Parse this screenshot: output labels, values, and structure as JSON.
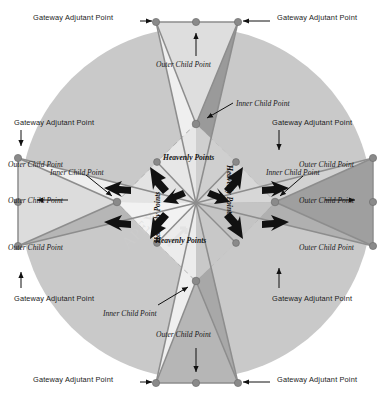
{
  "figure": {
    "background_color": "#ffffff",
    "circle": {
      "fill": "#c9c9c9",
      "center_x": 196,
      "center_y": 203,
      "radius": 176
    },
    "colors": {
      "circle_gray": "#c9c9c9",
      "light_blade": "#efefef",
      "mid_blade": "#b6b6b6",
      "dark_blade": "#9a9a9a",
      "line_gray": "#8d8d8d",
      "node_gray": "#8a8a8a",
      "dashed_gray": "#a8a8a8",
      "arrow_black": "#111111",
      "text_black": "#1b1b1b",
      "watermark": "#d8d8d8"
    },
    "watermark_text": "APEX"
  },
  "labels": {
    "gateway": "Gateway Adjutant Point",
    "outer_child": "Outer Child Point",
    "inner_child": "Inner Child Point",
    "heavenly": "Heavenly Points"
  },
  "callouts": [
    {
      "id": "gw-top-left",
      "text": "Gateway Adjutant Point",
      "x": 58,
      "y": 15,
      "arrow": "right"
    },
    {
      "id": "gw-top-right",
      "text": "Gateway Adjutant Point",
      "x": 280,
      "y": 15,
      "arrow": "left"
    },
    {
      "id": "gw-left-upper",
      "text": "Gateway Adjutant Point",
      "x": 16,
      "y": 122,
      "arrow": "down"
    },
    {
      "id": "gw-right-upper",
      "text": "Gateway Adjutant Point",
      "x": 274,
      "y": 122,
      "arrow": "down"
    },
    {
      "id": "gw-left-lower",
      "text": "Gateway Adjutant Point",
      "x": 16,
      "y": 290,
      "arrow": "up"
    },
    {
      "id": "gw-right-lower",
      "text": "Gateway Adjutant Point",
      "x": 274,
      "y": 290,
      "arrow": "up"
    },
    {
      "id": "gw-bottom-left",
      "text": "Gateway Adjutant Point",
      "x": 58,
      "y": 380,
      "arrow": "right"
    },
    {
      "id": "gw-bottom-right",
      "text": "Gateway Adjutant Point",
      "x": 280,
      "y": 380,
      "arrow": "left"
    },
    {
      "id": "oc-top",
      "text": "Outer Child Point",
      "x": 160,
      "y": 65,
      "arrow": "up"
    },
    {
      "id": "oc-bottom",
      "text": "Outer Child Point",
      "x": 160,
      "y": 333,
      "arrow": "down"
    },
    {
      "id": "oc-left",
      "text": "Outer Child Point",
      "x": 12,
      "y": 205,
      "arrow": "right"
    },
    {
      "id": "oc-right",
      "text": "Outer Child Point",
      "x": 300,
      "y": 205,
      "arrow": "left"
    },
    {
      "id": "oc-tl",
      "text": "Outer Child Point",
      "x": 8,
      "y": 197,
      "arrow": "none"
    },
    {
      "id": "ic-top",
      "text": "Inner Child Point",
      "x": 237,
      "y": 103,
      "arrow": "left"
    },
    {
      "id": "ic-bottom",
      "text": "Inner Child Point",
      "x": 104,
      "y": 313,
      "arrow": "right"
    },
    {
      "id": "ic-left",
      "text": "Inner Child Point",
      "x": 52,
      "y": 172,
      "arrow": "down-right"
    },
    {
      "id": "ic-right",
      "text": "Inner Child Point",
      "x": 268,
      "y": 172,
      "arrow": "down-left"
    },
    {
      "id": "hp-upper",
      "text": "Heavenly Points",
      "x": 165,
      "y": 158,
      "arrow": "pair-up"
    },
    {
      "id": "hp-lower",
      "text": "Heavenly Points",
      "x": 157,
      "y": 240,
      "arrow": "pair-down"
    },
    {
      "id": "hp-left",
      "text": "Heavenly Points",
      "x": 148,
      "y": 230,
      "arrow": "pair-left",
      "rotation": -90
    },
    {
      "id": "hp-right",
      "text": "Heavenly Points",
      "x": 228,
      "y": 172,
      "arrow": "pair-right",
      "rotation": 90
    }
  ],
  "geometry": {
    "description": "Four-armed star: each arm has two Gateway Adjutant Points at the rim, one Outer Child Point midway between them, and one Inner Child Point toward the centre. Eight Heavenly Points lie on a dashed diamond around the hub.",
    "gateway_points": [
      {
        "name": "top-left",
        "x": 156,
        "y": 22
      },
      {
        "name": "top-right",
        "x": 238,
        "y": 22
      },
      {
        "name": "left-top",
        "x": 18,
        "y": 158
      },
      {
        "name": "left-bottom",
        "x": 18,
        "y": 246
      },
      {
        "name": "right-top",
        "x": 373,
        "y": 158
      },
      {
        "name": "right-bottom",
        "x": 373,
        "y": 246
      },
      {
        "name": "bottom-left",
        "x": 156,
        "y": 383
      },
      {
        "name": "bottom-right",
        "x": 238,
        "y": 383
      }
    ],
    "outer_child_points": [
      {
        "name": "top",
        "x": 196,
        "y": 22
      },
      {
        "name": "left",
        "x": 18,
        "y": 202
      },
      {
        "name": "right",
        "x": 373,
        "y": 202
      },
      {
        "name": "bottom",
        "x": 196,
        "y": 383
      }
    ],
    "inner_child_points": [
      {
        "name": "top",
        "x": 196,
        "y": 124
      },
      {
        "name": "left",
        "x": 117,
        "y": 202
      },
      {
        "name": "right",
        "x": 275,
        "y": 202
      },
      {
        "name": "bottom",
        "x": 196,
        "y": 281
      }
    ],
    "heavenly_points": [
      {
        "name": "nw",
        "x": 157,
        "y": 162
      },
      {
        "name": "ne",
        "x": 236,
        "y": 162
      },
      {
        "name": "wn",
        "x": 157,
        "y": 162
      },
      {
        "name": "ws",
        "x": 157,
        "y": 243
      },
      {
        "name": "en",
        "x": 236,
        "y": 162
      },
      {
        "name": "es",
        "x": 236,
        "y": 243
      },
      {
        "name": "sw",
        "x": 157,
        "y": 243
      },
      {
        "name": "se",
        "x": 236,
        "y": 243
      }
    ],
    "center": {
      "x": 196,
      "y": 203
    }
  }
}
